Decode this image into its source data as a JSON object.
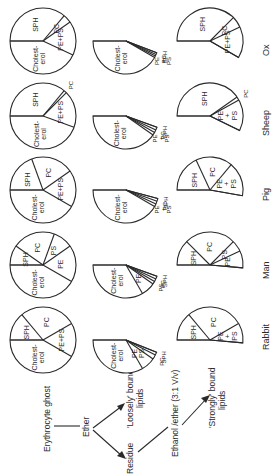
{
  "figure": {
    "orientation": "rotated-90-ccw",
    "stroke_color": "#2a2a2a",
    "background": "#ffffff"
  },
  "flow": {
    "start": "Erythrocyte ghost",
    "step1": "Ether",
    "branch_loose": "'Loosely' bound lipids",
    "branch_loose_line1": "'Loosely' bound",
    "branch_loose_line2": "lipids",
    "residue": "Residue",
    "step2": "Ethanol /ether (3:1 V/v)",
    "branch_strong": "'Strongly' bound lipids",
    "branch_strong_line1": "'Strongly' bound",
    "branch_strong_line2": "lipids"
  },
  "species": [
    {
      "name": "Ox",
      "total": {
        "slices": [
          {
            "label": "Cholest-\nerol",
            "deg": 155
          },
          {
            "label": "PE+PS",
            "deg": 60
          },
          {
            "label": "PC",
            "deg": 15
          },
          {
            "label": "SPH",
            "deg": 130
          }
        ]
      },
      "loosely": {
        "slices": [
          {
            "label": "Cholest-\nerol",
            "deg": 150
          },
          {
            "label": "PE\n+\nPS",
            "deg": 3
          },
          {
            "label": "PC",
            "deg": 3
          },
          {
            "label": "SPH",
            "deg": 3
          }
        ]
      },
      "strongly": {
        "slices": [
          {
            "label": "SPH",
            "deg": 135
          },
          {
            "label": "PC",
            "deg": 20
          },
          {
            "label": "PE+PS",
            "deg": 55
          }
        ]
      }
    },
    {
      "name": "Sheep",
      "total": {
        "slices": [
          {
            "label": "Cholest-\nerol",
            "deg": 160
          },
          {
            "label": "PE+PS",
            "deg": 65
          },
          {
            "label": "PC",
            "deg": 5
          },
          {
            "label": "SPH",
            "deg": 130
          }
        ]
      },
      "loosely": {
        "slices": [
          {
            "label": "Cholest-\nerol",
            "deg": 145
          },
          {
            "label": "PE\n+\nPS",
            "deg": 5
          },
          {
            "label": "PC",
            "deg": 5
          },
          {
            "label": "SPH",
            "deg": 5
          }
        ]
      },
      "strongly": {
        "slices": [
          {
            "label": "SPH",
            "deg": 145
          },
          {
            "label": "PC",
            "deg": 6
          },
          {
            "label": "PE\n+\nPS",
            "deg": 55
          }
        ]
      }
    },
    {
      "name": "Pig",
      "total": {
        "slices": [
          {
            "label": "Cholest-\nerol",
            "deg": 150
          },
          {
            "label": "PE+PS",
            "deg": 65
          },
          {
            "label": "PC",
            "deg": 75
          },
          {
            "label": "SPH",
            "deg": 70
          }
        ]
      },
      "loosely": {
        "slices": [
          {
            "label": "Cholest-\nerol",
            "deg": 150
          },
          {
            "label": "PE\n+\nPS",
            "deg": 5
          },
          {
            "label": "PC",
            "deg": 5
          },
          {
            "label": "SPH",
            "deg": 5
          }
        ]
      },
      "strongly": {
        "slices": [
          {
            "label": "SPH",
            "deg": 65
          },
          {
            "label": "PC",
            "deg": 65
          },
          {
            "label": "PE\n+\nPS",
            "deg": 60
          }
        ]
      }
    },
    {
      "name": "Man",
      "total": {
        "slices": [
          {
            "label": "Cholest-\nerol",
            "deg": 150
          },
          {
            "label": "PE",
            "deg": 65
          },
          {
            "label": "PS",
            "deg": 35
          },
          {
            "label": "PC",
            "deg": 75
          },
          {
            "label": "SPH",
            "deg": 35
          }
        ]
      },
      "loosely": {
        "slices": [
          {
            "label": "Cholest-\nerol",
            "deg": 120
          },
          {
            "label": "PE",
            "deg": 25
          },
          {
            "label": "PS",
            "deg": 5
          },
          {
            "label": "PC",
            "deg": 5
          },
          {
            "label": "SPH",
            "deg": 5
          }
        ]
      },
      "strongly": {
        "slices": [
          {
            "label": "SPH",
            "deg": 45
          },
          {
            "label": "PC",
            "deg": 90
          },
          {
            "label": "PS",
            "deg": 20
          },
          {
            "label": "PE",
            "deg": 30
          }
        ]
      }
    },
    {
      "name": "Rabbit",
      "total": {
        "slices": [
          {
            "label": "Cholest-\nerol",
            "deg": 150
          },
          {
            "label": "PE+PS",
            "deg": 60
          },
          {
            "label": "PC",
            "deg": 100
          },
          {
            "label": "SPH",
            "deg": 50
          }
        ]
      },
      "loosely": {
        "slices": [
          {
            "label": "Cholest-\nerol",
            "deg": 120
          },
          {
            "label": "PE\nPS",
            "deg": 25
          },
          {
            "label": "PC",
            "deg": 8
          },
          {
            "label": "SPH",
            "deg": 5
          }
        ]
      },
      "strongly": {
        "slices": [
          {
            "label": "SPH",
            "deg": 50
          },
          {
            "label": "PC",
            "deg": 100
          },
          {
            "label": "PE\n+\nPS",
            "deg": 35
          }
        ]
      }
    }
  ]
}
